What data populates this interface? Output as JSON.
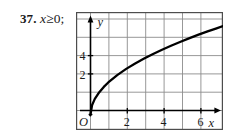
{
  "problem": {
    "number": "37.",
    "expression": "x",
    "operator": "≥",
    "value": "0",
    "terminator": ";",
    "full_text": "37. x ≥ 0;"
  },
  "figure": {
    "kind": "coordinate-grid-graph",
    "frame_color": "#4d4d4d",
    "grid_color": "#8c8c8c",
    "axis_color": "#000000",
    "curve_color": "#000000",
    "background": "#ffffff"
  },
  "chart_data": {
    "type": "line",
    "title": "",
    "subtitle": "",
    "xlabel": "x",
    "ylabel": "y",
    "function_label": "y = 2√x",
    "domain_note": "x ≥ 0",
    "xlim": [
      -0.8,
      7.4
    ],
    "ylim": [
      -0.9,
      6.3
    ],
    "grid": true,
    "grid_step_x": 1,
    "grid_step_y": 1,
    "legend": "none",
    "origin_label": "O",
    "x_tick_labels": [
      "2",
      "4",
      "6"
    ],
    "x_tick_values": [
      2,
      4,
      6
    ],
    "y_tick_labels": [
      "2",
      "4"
    ],
    "y_tick_values": [
      2,
      4
    ],
    "x_axis_arrow": true,
    "y_axis_arrow": true,
    "series": [
      {
        "name": "y = 2√x",
        "x": [
          0,
          0.1,
          0.25,
          0.5,
          0.75,
          1,
          1.5,
          2,
          2.5,
          3,
          3.5,
          4,
          4.5,
          5,
          5.5,
          6,
          6.5,
          7,
          7.4
        ],
        "y": [
          0,
          0.63,
          1.0,
          1.41,
          1.73,
          2.0,
          2.45,
          2.83,
          3.16,
          3.46,
          3.74,
          4.0,
          4.24,
          4.47,
          4.69,
          4.9,
          5.1,
          5.29,
          5.44
        ]
      }
    ]
  },
  "labels": {
    "y_axis_name": "y",
    "x_axis_name": "x",
    "origin": "O",
    "y_tick_4": "4",
    "y_tick_2": "2",
    "x_tick_2": "2",
    "x_tick_4": "4",
    "x_tick_6": "6"
  }
}
